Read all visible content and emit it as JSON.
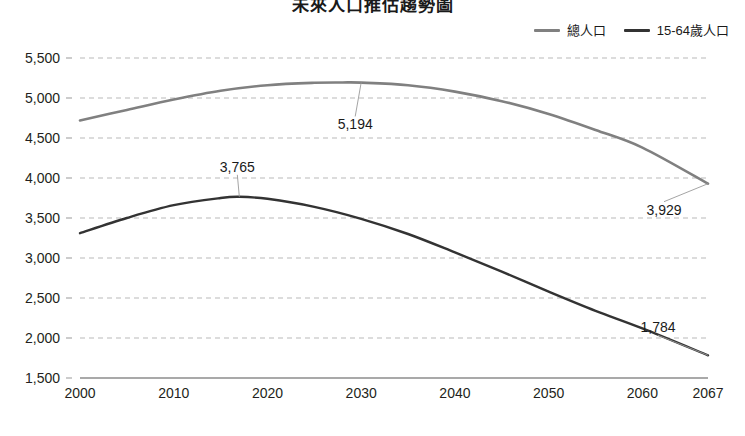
{
  "chart_data": {
    "type": "line",
    "title": "未來人口推估趨勢圖",
    "xlabel": "",
    "ylabel": "",
    "xlim": [
      2000,
      2067
    ],
    "ylim": [
      1500,
      5500
    ],
    "grid": true,
    "legend_position": "top-right",
    "x_ticks": [
      "2000",
      "2010",
      "2020",
      "2030",
      "2040",
      "2050",
      "2060",
      "2067"
    ],
    "x_tick_values": [
      2000,
      2010,
      2020,
      2030,
      2040,
      2050,
      2060,
      2067
    ],
    "y_ticks": [
      "5,500",
      "5,000",
      "4,500",
      "4,000",
      "3,500",
      "3,000",
      "2,500",
      "2,000",
      "1,500"
    ],
    "y_tick_values": [
      5500,
      5000,
      4500,
      4000,
      3500,
      3000,
      2500,
      2000,
      1500
    ],
    "series": [
      {
        "name": "總人口",
        "color": "#808080",
        "x": [
          2000,
          2005,
          2010,
          2015,
          2020,
          2025,
          2028,
          2030,
          2035,
          2040,
          2045,
          2050,
          2055,
          2060,
          2067
        ],
        "values": [
          4720,
          4850,
          4980,
          5090,
          5160,
          5190,
          5194,
          5192,
          5160,
          5080,
          4960,
          4800,
          4600,
          4380,
          3929
        ]
      },
      {
        "name": "15-64歲人口",
        "color": "#333333",
        "x": [
          2000,
          2005,
          2010,
          2015,
          2017,
          2020,
          2025,
          2030,
          2035,
          2040,
          2045,
          2050,
          2055,
          2060,
          2067
        ],
        "values": [
          3310,
          3500,
          3660,
          3750,
          3765,
          3740,
          3640,
          3490,
          3300,
          3070,
          2830,
          2580,
          2340,
          2120,
          1784
        ]
      }
    ],
    "annotations": [
      {
        "text": "5,194",
        "x": 2030,
        "y": 5194,
        "series": "總人口"
      },
      {
        "text": "3,929",
        "x": 2067,
        "y": 3929,
        "series": "總人口"
      },
      {
        "text": "3,765",
        "x": 2017,
        "y": 3765,
        "series": "15-64歲人口"
      },
      {
        "text": "1,784",
        "x": 2067,
        "y": 1784,
        "series": "15-64歲人口"
      }
    ]
  },
  "legend": {
    "items": [
      {
        "label": "總人口",
        "color": "#808080"
      },
      {
        "label": "15-64歲人口",
        "color": "#333333"
      }
    ]
  },
  "colors": {
    "total_population": "#808080",
    "working_age": "#333333",
    "gridline": "#b9b9b9",
    "axis": "#8c8c8c",
    "text": "#231f20"
  },
  "footer": {
    "caption": ""
  }
}
